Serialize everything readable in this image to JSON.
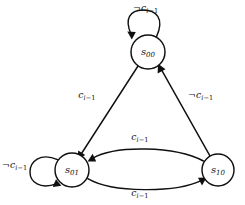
{
  "figure": {
    "kind": "state-transition-diagram",
    "background_color": "#ffffff",
    "ink_color": "#101010"
  },
  "nodes": [
    {
      "id": "s00",
      "label_base": "s",
      "label_sub": "00",
      "x": 148,
      "y": 52,
      "r": 17
    },
    {
      "id": "s01",
      "label_base": "s",
      "label_sub": "01",
      "x": 72,
      "y": 170,
      "r": 17
    },
    {
      "id": "s10",
      "label_base": "s",
      "label_sub": "10",
      "x": 218,
      "y": 170,
      "r": 16
    }
  ],
  "edges": [
    {
      "id": "s00-self",
      "from": "s00",
      "to": "s00",
      "kind": "self-loop",
      "label": {
        "neg": "¬",
        "base": "c",
        "sub_var": "i",
        "sub_op": "−",
        "sub_num": "1"
      },
      "label_x": 133,
      "label_y": 3
    },
    {
      "id": "s00-to-s01",
      "from": "s00",
      "to": "s01",
      "kind": "straight",
      "label": {
        "neg": "",
        "base": "c",
        "sub_var": "i",
        "sub_op": "−",
        "sub_num": "1"
      },
      "label_x": 78,
      "label_y": 90
    },
    {
      "id": "s10-to-s00",
      "from": "s10",
      "to": "s00",
      "kind": "straight",
      "label": {
        "neg": "¬",
        "base": "c",
        "sub_var": "i",
        "sub_op": "−",
        "sub_num": "1"
      },
      "label_x": 188,
      "label_y": 90
    },
    {
      "id": "s01-self",
      "from": "s01",
      "to": "s01",
      "kind": "self-loop",
      "label": {
        "neg": "¬",
        "base": "c",
        "sub_var": "i",
        "sub_op": "−",
        "sub_num": "1"
      },
      "label_x": 2,
      "label_y": 160
    },
    {
      "id": "s10-to-s01",
      "from": "s10",
      "to": "s01",
      "kind": "curve-upper",
      "label": {
        "neg": "",
        "base": "c",
        "sub_var": "i",
        "sub_op": "−",
        "sub_num": "1"
      },
      "label_x": 131,
      "label_y": 132
    },
    {
      "id": "s01-to-s10",
      "from": "s01",
      "to": "s10",
      "kind": "curve-lower",
      "label": {
        "neg": "",
        "base": "c",
        "sub_var": "i",
        "sub_op": "−",
        "sub_num": "1"
      },
      "label_x": 131,
      "label_y": 188
    }
  ]
}
